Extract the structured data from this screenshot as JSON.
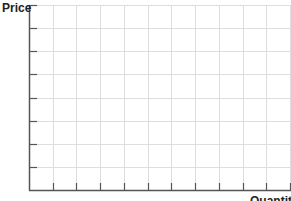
{
  "chart_data": {
    "type": "line",
    "title": "",
    "xlabel": "Quantity",
    "ylabel": "Price",
    "series": [],
    "x_ticks": [],
    "y_ticks": [],
    "grid": true,
    "x_grid_count": 11,
    "y_grid_count": 8,
    "legend": null,
    "note": "Blank price-quantity graph template with grid, no data plotted",
    "colors": {
      "grid": "#dddddd",
      "axis": "#555555",
      "label": "#222222"
    }
  }
}
